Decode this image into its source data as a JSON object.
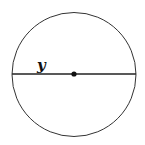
{
  "diagram": {
    "title": "",
    "shape": "circle",
    "segment": {
      "type": "diameter",
      "label": "y"
    },
    "center_point": true,
    "colors": {
      "stroke": "#222222",
      "background": "#ffffff"
    }
  }
}
